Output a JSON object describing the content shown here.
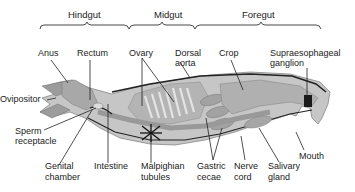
{
  "diagram": {
    "sections": [
      {
        "label": "Hindgut"
      },
      {
        "label": "Midgut"
      },
      {
        "label": "Foregut"
      }
    ],
    "labels": {
      "anus": "Anus",
      "rectum": "Rectum",
      "ovary": "Ovary",
      "dorsal_aorta_1": "Dorsal",
      "dorsal_aorta_2": "aorta",
      "crop": "Crop",
      "supra_1": "Supraesophageal",
      "supra_2": "ganglion",
      "ovipositor": "Ovipositor",
      "sperm_1": "Sperm",
      "sperm_2": "receptacle",
      "genital_1": "Genital",
      "genital_2": "chamber",
      "intestine": "Intestine",
      "malpighian_1": "Malpighian",
      "malpighian_2": "tubules",
      "gastric_1": "Gastric",
      "gastric_2": "cecae",
      "nerve_1": "Nerve",
      "nerve_2": "cord",
      "salivary_1": "Salivary",
      "salivary_2": "gland",
      "mouth": "Mouth"
    }
  }
}
